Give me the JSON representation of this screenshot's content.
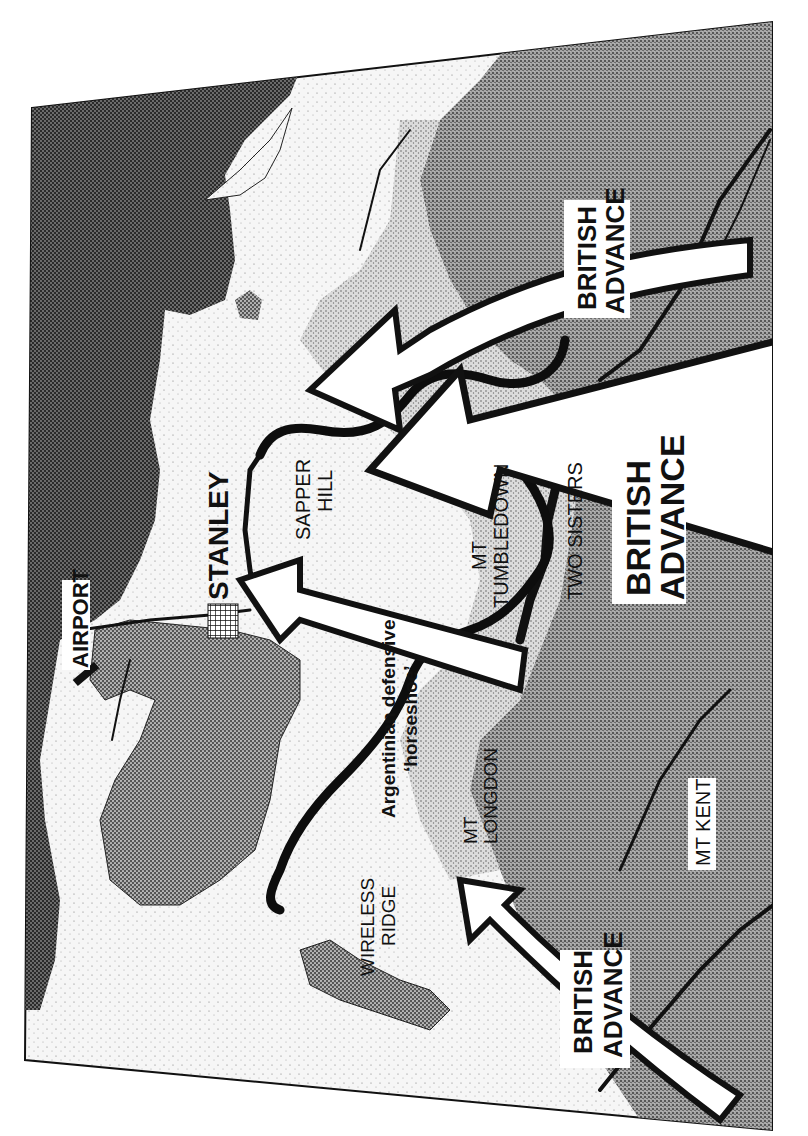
{
  "map": {
    "orientation": "rotated 90 degrees counter-clockwise",
    "colors": {
      "sea": "#3a3a3a",
      "inner_harbour": "#6e6e6e",
      "lowland": "#f4f4f4",
      "highland": "#9a9a9a",
      "ink": "#111111",
      "arrow_fill": "#ffffff"
    },
    "labels": {
      "airport": "AIRPORT",
      "stanley": "STANLEY",
      "sapper_hill_line1": "SAPPER",
      "sapper_hill_line2": "HILL",
      "mt_tumbledown_line1": "MT",
      "mt_tumbledown_line2": "TUMBLEDOWN",
      "two_sisters": "TWO SISTERS",
      "mt_longdon_line1": "MT",
      "mt_longdon_line2": "LONGDON",
      "wireless_ridge_line1": "WIRELESS",
      "wireless_ridge_line2": "RIDGE",
      "mt_kent": "MT KENT",
      "horseshoe_line1": "Argentinian defensive",
      "horseshoe_line2": "‘horseshoe’",
      "advance_south_line1": "BRITISH",
      "advance_south_line2": "ADVANCE",
      "advance_centre_line1": "BRITISH",
      "advance_centre_line2": "ADVANCE",
      "advance_west_line1": "BRITISH",
      "advance_west_line2": "ADVANCE",
      "advance_north_line1": "BRITISH",
      "advance_north_line2": "ADVANCE"
    },
    "icons": {
      "town": "grid-hatch",
      "airport": "runway-bar",
      "advance": "white-arrow"
    }
  }
}
